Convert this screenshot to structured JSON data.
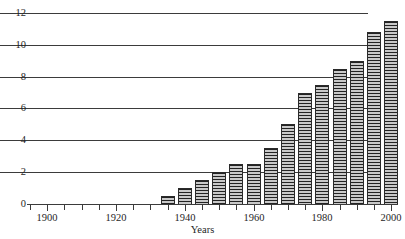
{
  "chart_data": {
    "type": "bar",
    "title": "",
    "subtitle": "",
    "xlabel": "Years",
    "ylabel": "",
    "xlim": [
      1895,
      2002
    ],
    "ylim": [
      0,
      12
    ],
    "grid": true,
    "legend": null,
    "y_ticks": [
      0,
      2,
      4,
      6,
      8,
      10,
      12
    ],
    "x_ticks_major": [
      1900,
      1920,
      1940,
      1960,
      1980,
      2000
    ],
    "x_ticks_minor": [
      1895,
      1905,
      1910,
      1915,
      1925,
      1930,
      1935,
      1945,
      1950,
      1955,
      1965,
      1970,
      1975,
      1985,
      1990,
      1995
    ],
    "categories": [
      1935,
      1940,
      1945,
      1950,
      1955,
      1960,
      1965,
      1970,
      1975,
      1980,
      1985,
      1990,
      1995,
      2000
    ],
    "values": [
      0.5,
      1.0,
      1.5,
      2.0,
      2.5,
      2.5,
      3.5,
      5.0,
      7.0,
      7.5,
      8.5,
      9.0,
      10.8,
      11.5
    ],
    "bar_fill": "horizontal-stripe-hatch",
    "bar_color": "#8d8d8d",
    "grid_color": "#3b3b3b"
  },
  "axis": {
    "y_tick_labels": [
      "0",
      "2",
      "4",
      "6",
      "8",
      "10",
      "12"
    ],
    "x_tick_labels": [
      "1900",
      "1920",
      "1940",
      "1960",
      "1980",
      "2000"
    ],
    "x_axis_title": "Years"
  }
}
